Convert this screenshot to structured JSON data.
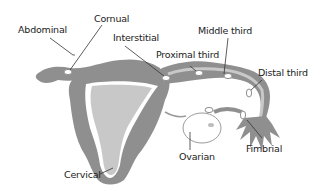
{
  "diagram": {
    "colors": {
      "wall": "#8f8f8f",
      "lining": "#bdbdbd",
      "cavity": "#c8c8c8",
      "ovary_outline": "#9a9a9a",
      "label": "#222222",
      "leader": "#333333"
    },
    "labels": {
      "abdominal": "Abdominal",
      "cornual": "Cornual",
      "interstitial": "Interstitial",
      "proximal_third": "Proximal third",
      "middle_third": "Middle third",
      "distal_third": "Distal third",
      "fimbrial": "Fimbrial",
      "ovarian": "Ovarian",
      "cervical": "Cervical"
    }
  }
}
